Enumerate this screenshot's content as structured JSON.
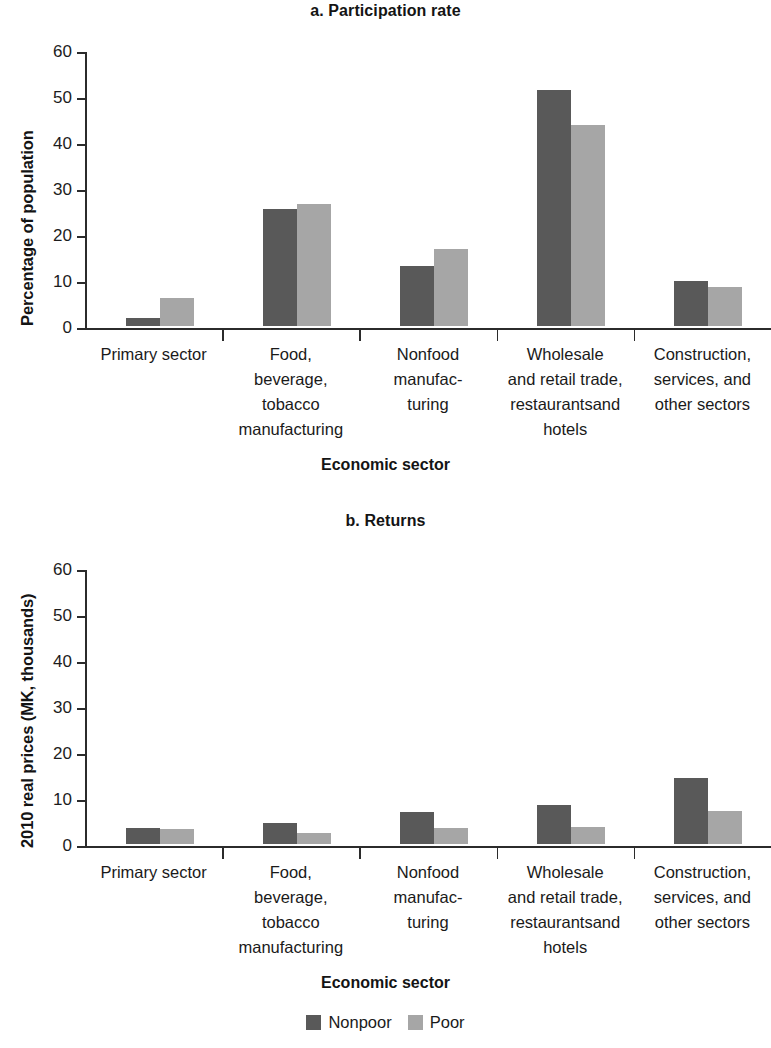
{
  "figure": {
    "panel_a_title": "a. Participation rate",
    "panel_b_title": "b. Returns",
    "x_axis_title_a": "Economic sector",
    "x_axis_title_b": "Economic sector",
    "y_axis_title_a": "Percentage of population",
    "y_axis_title_b": "2010 real prices (MK, thousands)"
  },
  "colors": {
    "nonpoor": "#595959",
    "poor": "#a6a6a6",
    "axis": "#2b2b2b",
    "text": "#1a1a1a",
    "background": "#ffffff"
  },
  "legend": {
    "position": "bottom-center",
    "items": [
      {
        "label": "Nonpoor",
        "color": "#595959"
      },
      {
        "label": "Poor",
        "color": "#a6a6a6"
      }
    ]
  },
  "categories": [
    [
      "Primary sector"
    ],
    [
      "Food,",
      "beverage,",
      "tobacco",
      "manufacturing"
    ],
    [
      "Nonfood",
      "manufac-",
      "turing"
    ],
    [
      "Wholesale",
      "and retail trade,",
      "restaurantsand",
      "hotels"
    ],
    [
      "Construction,",
      "services, and",
      "other sectors"
    ]
  ],
  "y_ticks": [
    "0",
    "10",
    "20",
    "30",
    "40",
    "50",
    "60"
  ],
  "chart_data": [
    {
      "type": "bar",
      "title": "a. Participation rate",
      "xlabel": "Economic sector",
      "ylabel": "Percentage of population",
      "ylim": [
        0,
        60
      ],
      "yticks": [
        0,
        10,
        20,
        30,
        40,
        50,
        60
      ],
      "grid": false,
      "legend_position": "bottom-center",
      "categories": [
        "Primary sector",
        "Food, beverage, tobacco manufacturing",
        "Nonfood manufacturing",
        "Wholesale and retail trade, restaurants and hotels",
        "Construction, services, and other sectors"
      ],
      "series": [
        {
          "name": "Nonpoor",
          "color": "#595959",
          "values": [
            1.8,
            25.5,
            13.0,
            51.4,
            9.7
          ]
        },
        {
          "name": "Poor",
          "color": "#a6a6a6",
          "values": [
            6.0,
            26.5,
            16.8,
            43.7,
            8.5
          ]
        }
      ]
    },
    {
      "type": "bar",
      "title": "b. Returns",
      "xlabel": "Economic sector",
      "ylabel": "2010 real prices (MK, thousands)",
      "ylim": [
        0,
        60
      ],
      "yticks": [
        0,
        10,
        20,
        30,
        40,
        50,
        60
      ],
      "grid": false,
      "legend_position": "bottom-center",
      "categories": [
        "Primary sector",
        "Food, beverage, tobacco manufacturing",
        "Nonfood manufacturing",
        "Wholesale and retail trade, restaurants and hotels",
        "Construction, services, and other sectors"
      ],
      "series": [
        {
          "name": "Nonpoor",
          "color": "#595959",
          "values": [
            3.4,
            4.6,
            7.0,
            8.4,
            14.3
          ]
        },
        {
          "name": "Poor",
          "color": "#a6a6a6",
          "values": [
            3.3,
            2.5,
            3.4,
            3.7,
            7.1
          ]
        }
      ]
    }
  ]
}
